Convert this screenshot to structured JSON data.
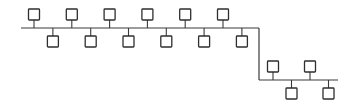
{
  "diagram": {
    "type": "network-bus-topology",
    "segments": [
      {
        "name": "segment-1",
        "nodes": [
          {
            "id": "n1",
            "side": "top"
          },
          {
            "id": "n2",
            "side": "bottom"
          },
          {
            "id": "n3",
            "side": "top"
          },
          {
            "id": "n4",
            "side": "bottom"
          },
          {
            "id": "n5",
            "side": "top"
          },
          {
            "id": "n6",
            "side": "bottom"
          },
          {
            "id": "n7",
            "side": "top"
          },
          {
            "id": "n8",
            "side": "bottom"
          },
          {
            "id": "n9",
            "side": "top"
          },
          {
            "id": "n10",
            "side": "bottom"
          },
          {
            "id": "n11",
            "side": "top"
          },
          {
            "id": "n12",
            "side": "bottom"
          }
        ]
      },
      {
        "name": "segment-2",
        "nodes": [
          {
            "id": "n13",
            "side": "top"
          },
          {
            "id": "n14",
            "side": "bottom"
          },
          {
            "id": "n15",
            "side": "top"
          },
          {
            "id": "n16",
            "side": "bottom"
          }
        ]
      }
    ],
    "links": [
      {
        "from": "segment-1",
        "to": "segment-2",
        "kind": "vertical-connector"
      }
    ],
    "colors": {
      "line": "#3a3a3a",
      "node_stroke": "#2e2e2e",
      "node_fill": "#ffffff",
      "background": "#ffffff"
    }
  }
}
